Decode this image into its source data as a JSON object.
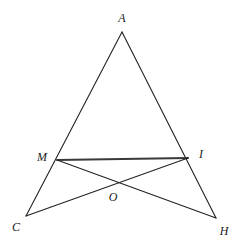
{
  "figure": {
    "type": "geometry-diagram",
    "background_color": "#ffffff",
    "stroke_color": "#222222",
    "emphasis_stroke_color": "#3a3a3a",
    "label_color": "#1a1a1a",
    "width": 237,
    "height": 251,
    "points": [
      {
        "name": "A",
        "label": "A",
        "x": 122,
        "y": 32,
        "label_x": 122,
        "label_y": 18
      },
      {
        "name": "M",
        "label": "M",
        "x": 57,
        "y": 160,
        "label_x": 42,
        "label_y": 157
      },
      {
        "name": "I",
        "label": "I",
        "x": 188,
        "y": 158,
        "label_x": 201,
        "label_y": 154
      },
      {
        "name": "C",
        "label": "C",
        "x": 26,
        "y": 216,
        "label_x": 16,
        "label_y": 227
      },
      {
        "name": "H",
        "label": "H",
        "x": 216,
        "y": 218,
        "label_x": 224,
        "label_y": 231
      },
      {
        "name": "O",
        "label": "O",
        "x": 113,
        "y": 185,
        "label_x": 113,
        "label_y": 197
      }
    ],
    "segments": [
      {
        "name": "segment-A-C",
        "from": "A",
        "to": "C",
        "width": 1.1,
        "color": "#222222"
      },
      {
        "name": "segment-A-H",
        "from": "A",
        "to": "H",
        "width": 1.1,
        "color": "#222222"
      },
      {
        "name": "segment-M-I",
        "from": "M",
        "to": "I",
        "width": 1.9,
        "color": "#3a3a3a"
      },
      {
        "name": "segment-M-H",
        "from": "M",
        "to": "H",
        "width": 1.1,
        "color": "#222222"
      },
      {
        "name": "segment-C-I",
        "from": "C",
        "to": "I",
        "width": 1.1,
        "color": "#222222"
      }
    ]
  }
}
